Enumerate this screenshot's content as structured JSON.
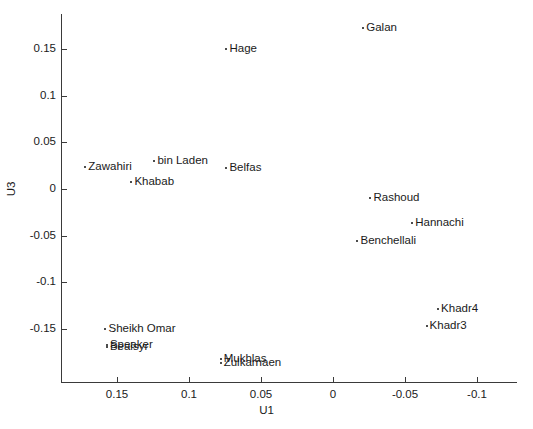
{
  "chart_data": {
    "type": "scatter",
    "title": "",
    "xlabel": "U1",
    "ylabel": "U3",
    "xlim": [
      0.175,
      -0.115
    ],
    "ylim": [
      -0.18,
      0.18
    ],
    "x_reversed": true,
    "grid": false,
    "legend": null,
    "xticks": [
      0.15,
      0.1,
      0.05,
      0,
      -0.05,
      -0.1
    ],
    "xticklabels": [
      "0.15",
      "0.1",
      "0.05",
      "0",
      "-0.05",
      "-0.1"
    ],
    "yticks": [
      0.15,
      0.1,
      0.05,
      0,
      -0.05,
      -0.1,
      -0.15
    ],
    "yticklabels": [
      "0.15",
      "0.1",
      "0.05",
      "0",
      "-0.05",
      "-0.1",
      "-0.15"
    ],
    "points": [
      {
        "label": "Galan",
        "x": -0.021,
        "y": 0.172
      },
      {
        "label": "Hage",
        "x": 0.074,
        "y": 0.15
      },
      {
        "label": "bin Laden",
        "x": 0.124,
        "y": 0.03
      },
      {
        "label": "Zawahiri",
        "x": 0.172,
        "y": 0.024
      },
      {
        "label": "Belfas",
        "x": 0.074,
        "y": 0.023
      },
      {
        "label": "Khabab",
        "x": 0.14,
        "y": 0.007
      },
      {
        "label": "Rashoud",
        "x": -0.026,
        "y": -0.01
      },
      {
        "label": "Hannachi",
        "x": -0.055,
        "y": -0.036
      },
      {
        "label": "Benchellali",
        "x": -0.017,
        "y": -0.056
      },
      {
        "label": "Khadr4",
        "x": -0.073,
        "y": -0.129
      },
      {
        "label": "Sheikh Omar",
        "x": 0.158,
        "y": -0.15
      },
      {
        "label": "Khadr3",
        "x": -0.065,
        "y": -0.147
      },
      {
        "label": "Speaker",
        "x": 0.157,
        "y": -0.167
      },
      {
        "label": "Bealsyr",
        "x": 0.157,
        "y": -0.169
      },
      {
        "label": "Mukhlas",
        "x": 0.078,
        "y": -0.182
      },
      {
        "label": "Zulkarnaen",
        "x": 0.078,
        "y": -0.186
      }
    ]
  },
  "axes": {
    "xlabel": "U1",
    "ylabel": "U3"
  }
}
